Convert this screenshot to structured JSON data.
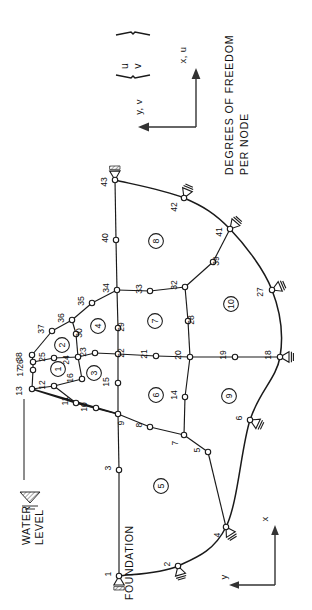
{
  "figure": {
    "type": "finite-element-mesh-diagram",
    "orientation_note": "Drawing rotated 90 degrees clockwise; all text reads bottom-to-top",
    "annotations": {
      "water_level": "WATER\nLEVEL",
      "water_level_line1": "WATER",
      "water_level_line2": "LEVEL",
      "foundation": "FOUNDATION",
      "dof_line1": "DEGREES OF FREEDOM",
      "dof_line2": "PER NODE",
      "dof_u": "u",
      "dof_v": "v"
    },
    "axes": {
      "global": {
        "x_label": "x, u",
        "y_label": "y, v"
      },
      "local": {
        "x_label": "x",
        "y_label": "y"
      }
    },
    "counts": {
      "nodes": 43,
      "elements": 10
    }
  },
  "nodes": [
    {
      "id": "1",
      "x": 119,
      "y": 576,
      "support": "pinned"
    },
    {
      "id": "2",
      "x": 178,
      "y": 566,
      "support": "roller"
    },
    {
      "id": "3",
      "x": 119,
      "y": 470,
      "support": "none"
    },
    {
      "id": "4",
      "x": 226,
      "y": 527,
      "support": "roller"
    },
    {
      "id": "5",
      "x": 208,
      "y": 452,
      "support": "none"
    },
    {
      "id": "6",
      "x": 250,
      "y": 420,
      "support": "roller"
    },
    {
      "id": "7",
      "x": 184,
      "y": 435,
      "support": "none"
    },
    {
      "id": "8",
      "x": 150,
      "y": 427,
      "support": "none"
    },
    {
      "id": "9",
      "x": 118,
      "y": 414,
      "support": "none"
    },
    {
      "id": "10",
      "x": 96,
      "y": 408,
      "support": "none"
    },
    {
      "id": "11",
      "x": 76,
      "y": 403,
      "support": "none"
    },
    {
      "id": "12",
      "x": 54,
      "y": 386,
      "support": "none"
    },
    {
      "id": "13",
      "x": 32,
      "y": 389,
      "support": "none"
    },
    {
      "id": "14",
      "x": 185,
      "y": 397,
      "support": "none"
    },
    {
      "id": "15",
      "x": 118,
      "y": 383,
      "support": "none"
    },
    {
      "id": "16",
      "x": 82,
      "y": 379,
      "support": "none"
    },
    {
      "id": "17",
      "x": 33,
      "y": 370,
      "support": "none"
    },
    {
      "id": "18",
      "x": 280,
      "y": 357,
      "support": "roller"
    },
    {
      "id": "19",
      "x": 235,
      "y": 357,
      "support": "none"
    },
    {
      "id": "20",
      "x": 190,
      "y": 357,
      "support": "none"
    },
    {
      "id": "21",
      "x": 156,
      "y": 356,
      "support": "none"
    },
    {
      "id": "22",
      "x": 118,
      "y": 354,
      "support": "none"
    },
    {
      "id": "23",
      "x": 95,
      "y": 353,
      "support": "none"
    },
    {
      "id": "24",
      "x": 78,
      "y": 357,
      "support": "none"
    },
    {
      "id": "25",
      "x": 54,
      "y": 358,
      "support": "none"
    },
    {
      "id": "26",
      "x": 33,
      "y": 362,
      "support": "none"
    },
    {
      "id": "27",
      "x": 272,
      "y": 290,
      "support": "roller"
    },
    {
      "id": "28",
      "x": 188,
      "y": 321,
      "support": "none"
    },
    {
      "id": "29",
      "x": 118,
      "y": 328,
      "support": "none"
    },
    {
      "id": "30",
      "x": 76,
      "y": 334,
      "support": "none"
    },
    {
      "id": "32",
      "x": 185,
      "y": 287,
      "support": "none"
    },
    {
      "id": "33",
      "x": 150,
      "y": 291,
      "support": "none"
    },
    {
      "id": "34",
      "x": 117,
      "y": 290,
      "support": "none"
    },
    {
      "id": "35",
      "x": 92,
      "y": 303,
      "support": "none"
    },
    {
      "id": "36",
      "x": 72,
      "y": 320,
      "support": "none"
    },
    {
      "id": "37",
      "x": 52,
      "y": 331,
      "support": "none"
    },
    {
      "id": "38",
      "x": 32,
      "y": 355,
      "support": "none"
    },
    {
      "id": "39",
      "x": 213,
      "y": 262,
      "support": "none"
    },
    {
      "id": "40",
      "x": 116,
      "y": 240,
      "support": "none"
    },
    {
      "id": "41",
      "x": 230,
      "y": 229,
      "support": "roller"
    },
    {
      "id": "42",
      "x": 184,
      "y": 198,
      "support": "roller"
    },
    {
      "id": "43",
      "x": 115,
      "y": 180,
      "support": "pinned"
    }
  ],
  "node_label_offsets": [
    {
      "id": "1",
      "dx": -10,
      "dy": -2
    },
    {
      "id": "2",
      "dx": -10,
      "dy": -2
    },
    {
      "id": "3",
      "dx": -10,
      "dy": -2
    },
    {
      "id": "4",
      "dx": -8,
      "dy": 8
    },
    {
      "id": "5",
      "dx": -10,
      "dy": -2
    },
    {
      "id": "6",
      "dx": -10,
      "dy": -2
    },
    {
      "id": "7",
      "dx": -8,
      "dy": 8
    },
    {
      "id": "8",
      "dx": -10,
      "dy": -2
    },
    {
      "id": "9",
      "dx": 4,
      "dy": 9
    },
    {
      "id": "10",
      "dx": -11,
      "dy": -1
    },
    {
      "id": "11",
      "dx": -10,
      "dy": -2
    },
    {
      "id": "12",
      "dx": -11,
      "dy": -1
    },
    {
      "id": "13",
      "dx": -12,
      "dy": 2
    },
    {
      "id": "14",
      "dx": -10,
      "dy": -2
    },
    {
      "id": "15",
      "dx": -11,
      "dy": -1
    },
    {
      "id": "16",
      "dx": -11,
      "dy": -1
    },
    {
      "id": "17",
      "dx": -12,
      "dy": 2
    },
    {
      "id": "18",
      "dx": -11,
      "dy": -2
    },
    {
      "id": "19",
      "dx": -11,
      "dy": -2
    },
    {
      "id": "20",
      "dx": -11,
      "dy": -2
    },
    {
      "id": "21",
      "dx": -11,
      "dy": -2
    },
    {
      "id": "22",
      "dx": 4,
      "dy": -1
    },
    {
      "id": "23",
      "dx": -11,
      "dy": -1
    },
    {
      "id": "24",
      "dx": -11,
      "dy": 3
    },
    {
      "id": "25",
      "dx": -11,
      "dy": -1
    },
    {
      "id": "26",
      "dx": -12,
      "dy": 2
    },
    {
      "id": "27",
      "dx": -11,
      "dy": 2
    },
    {
      "id": "28",
      "dx": 4,
      "dy": -1
    },
    {
      "id": "29",
      "dx": 4,
      "dy": -1
    },
    {
      "id": "30",
      "dx": 4,
      "dy": -1
    },
    {
      "id": "32",
      "dx": -10,
      "dy": -2
    },
    {
      "id": "33",
      "dx": -10,
      "dy": -2
    },
    {
      "id": "34",
      "dx": -10,
      "dy": -2
    },
    {
      "id": "35",
      "dx": -10,
      "dy": -2
    },
    {
      "id": "36",
      "dx": -10,
      "dy": -2
    },
    {
      "id": "37",
      "dx": -10,
      "dy": -2
    },
    {
      "id": "38",
      "dx": -12,
      "dy": 2
    },
    {
      "id": "39",
      "dx": 4,
      "dy": -1
    },
    {
      "id": "40",
      "dx": -10,
      "dy": -2
    },
    {
      "id": "41",
      "dx": -10,
      "dy": 3
    },
    {
      "id": "42",
      "dx": -9,
      "dy": 9
    },
    {
      "id": "43",
      "dx": -10,
      "dy": 2
    }
  ],
  "elements": [
    {
      "id": "1",
      "x": 58,
      "y": 369
    },
    {
      "id": "2",
      "x": 62,
      "y": 345
    },
    {
      "id": "3",
      "x": 94,
      "y": 373
    },
    {
      "id": "4",
      "x": 98,
      "y": 326
    },
    {
      "id": "5",
      "x": 161,
      "y": 486
    },
    {
      "id": "6",
      "x": 156,
      "y": 395
    },
    {
      "id": "7",
      "x": 155,
      "y": 321
    },
    {
      "id": "8",
      "x": 156,
      "y": 241
    },
    {
      "id": "9",
      "x": 229,
      "y": 396
    },
    {
      "id": "10",
      "x": 231,
      "y": 304
    }
  ],
  "mesh_edges": [
    {
      "from": "1",
      "to": "3",
      "curve": false
    },
    {
      "from": "3",
      "to": "9",
      "curve": false
    },
    {
      "from": "9",
      "to": "15",
      "curve": false
    },
    {
      "from": "15",
      "to": "22",
      "curve": false
    },
    {
      "from": "22",
      "to": "29",
      "curve": false
    },
    {
      "from": "29",
      "to": "34",
      "curve": false
    },
    {
      "from": "34",
      "to": "40",
      "curve": false
    },
    {
      "from": "40",
      "to": "43",
      "curve": false
    },
    {
      "from": "13",
      "to": "17",
      "curve": false
    },
    {
      "from": "17",
      "to": "26",
      "curve": false
    },
    {
      "from": "26",
      "to": "38",
      "curve": false
    },
    {
      "from": "38",
      "to": "37",
      "curve": false
    },
    {
      "from": "37",
      "to": "36",
      "curve": false
    },
    {
      "from": "36",
      "to": "35",
      "curve": false
    },
    {
      "from": "35",
      "to": "34",
      "curve": false
    },
    {
      "from": "13",
      "to": "12",
      "curve": false
    },
    {
      "from": "12",
      "to": "11",
      "curve": false
    },
    {
      "from": "11",
      "to": "10",
      "curve": false
    },
    {
      "from": "10",
      "to": "9",
      "curve": false
    },
    {
      "from": "26",
      "to": "25",
      "curve": false
    },
    {
      "from": "25",
      "to": "24",
      "curve": false
    },
    {
      "from": "24",
      "to": "23",
      "curve": false
    },
    {
      "from": "23",
      "to": "22",
      "curve": false
    },
    {
      "from": "22",
      "to": "21",
      "curve": false
    },
    {
      "from": "21",
      "to": "20",
      "curve": false
    },
    {
      "from": "20",
      "to": "19",
      "curve": false
    },
    {
      "from": "19",
      "to": "18",
      "curve": false
    },
    {
      "from": "36",
      "to": "30",
      "curve": false
    },
    {
      "from": "30",
      "to": "24",
      "curve": false
    },
    {
      "from": "24",
      "to": "16",
      "curve": false
    },
    {
      "from": "16",
      "to": "12",
      "curve": false
    },
    {
      "from": "34",
      "to": "33",
      "curve": false
    },
    {
      "from": "33",
      "to": "32",
      "curve": false
    },
    {
      "from": "32",
      "to": "28",
      "curve": false
    },
    {
      "from": "28",
      "to": "20",
      "curve": false
    },
    {
      "from": "20",
      "to": "14",
      "curve": false
    },
    {
      "from": "14",
      "to": "7",
      "curve": false
    },
    {
      "from": "7",
      "to": "8",
      "curve": false
    },
    {
      "from": "8",
      "to": "9",
      "curve": false
    },
    {
      "from": "32",
      "to": "39",
      "curve": false
    },
    {
      "from": "39",
      "to": "41",
      "curve": false
    },
    {
      "from": "7",
      "to": "5",
      "curve": false
    },
    {
      "from": "5",
      "to": "4",
      "curve": false
    }
  ],
  "arc_boundary": {
    "description": "Outer curved foundation boundary from node 1 through 2,4,6,18,27,41,42 to 43",
    "node_sequence": [
      "1",
      "2",
      "4",
      "6",
      "18",
      "27",
      "41",
      "42",
      "43"
    ]
  },
  "dam_body": {
    "description": "Hatched triangular dam cross-section upstream of node 9",
    "vertices": [
      "13",
      "9",
      "11"
    ],
    "hatch_color": "#555555"
  },
  "colors": {
    "ink": "#111111",
    "line": "#1a1a1a",
    "node_fill": "#ffffff",
    "hatch": "#666666",
    "paper": "#ffffff"
  }
}
